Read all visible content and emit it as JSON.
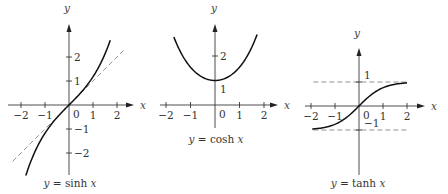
{
  "chart_data": [
    {
      "type": "line",
      "title": "y = sinh x",
      "caption": {
        "prefix": "y",
        "eq": " = sinh ",
        "var": "x"
      },
      "xlabel": "x",
      "ylabel": "y",
      "xlim": [
        -2,
        2.5
      ],
      "ylim": [
        -2.9,
        3.3
      ],
      "x_ticks": [
        -2,
        -1,
        1,
        2
      ],
      "x_tick_labels": [
        "−2",
        "−1",
        "1",
        "2"
      ],
      "y_ticks": [
        -2,
        -1,
        1,
        2
      ],
      "y_tick_labels": [
        "−2",
        "−1",
        "1",
        "2"
      ],
      "origin_label": "0",
      "series": [
        {
          "name": "sinh x",
          "style": "solid",
          "function": "sinh",
          "x_range": [
            -1.8,
            1.72
          ],
          "x": [
            -1.8,
            -1.5,
            -1.0,
            -0.5,
            0,
            0.5,
            1.0,
            1.5,
            1.72
          ],
          "y": [
            -2.94,
            -2.13,
            -1.18,
            -0.52,
            0,
            0.52,
            1.18,
            2.13,
            2.71
          ]
        },
        {
          "name": "y = x (asymptote near origin)",
          "style": "dashed",
          "function": "identity",
          "x_range": [
            -2.35,
            2.3
          ],
          "x": [
            -2.35,
            2.3
          ],
          "y": [
            -2.35,
            2.3
          ]
        }
      ],
      "grid": false,
      "legend": "none"
    },
    {
      "type": "line",
      "title": "y = cosh x",
      "caption": {
        "prefix": "y",
        "eq": " = cosh ",
        "var": "x"
      },
      "xlabel": "x",
      "ylabel": "y",
      "xlim": [
        -2.1,
        2.5
      ],
      "ylim": [
        -0.95,
        3.3
      ],
      "x_ticks": [
        -2,
        -1,
        1,
        2
      ],
      "x_tick_labels": [
        "−2",
        "−1",
        "1",
        "2"
      ],
      "y_ticks": [
        1,
        2
      ],
      "y_tick_labels": [
        "1",
        "2"
      ],
      "origin_label": "0",
      "series": [
        {
          "name": "cosh x",
          "style": "solid",
          "function": "cosh",
          "x_range": [
            -1.68,
            1.72
          ],
          "x": [
            -1.68,
            -1.5,
            -1.0,
            -0.5,
            0,
            0.5,
            1.0,
            1.5,
            1.72
          ],
          "y": [
            2.77,
            2.35,
            1.54,
            1.13,
            1.0,
            1.13,
            1.54,
            2.35,
            2.88
          ]
        }
      ],
      "grid": false,
      "legend": "none"
    },
    {
      "type": "line",
      "title": "y = tanh x",
      "caption": {
        "prefix": "y",
        "eq": " = tanh ",
        "var": "x"
      },
      "xlabel": "x",
      "ylabel": "y",
      "xlim": [
        -2.1,
        2.5
      ],
      "ylim": [
        -2.8,
        2.4
      ],
      "x_ticks": [
        -2,
        -1,
        1,
        2
      ],
      "x_tick_labels": [
        "−2",
        "−1",
        "1",
        "2"
      ],
      "y_ticks": [
        1,
        -1
      ],
      "y_tick_labels": [
        "1",
        "−1"
      ],
      "origin_label": "0",
      "series": [
        {
          "name": "tanh x",
          "style": "solid",
          "function": "tanh",
          "x_range": [
            -1.95,
            2.0
          ],
          "x": [
            -1.95,
            -1.5,
            -1.0,
            -0.5,
            0,
            0.5,
            1.0,
            1.5,
            2.0
          ],
          "y": [
            -0.96,
            -0.91,
            -0.76,
            -0.46,
            0,
            0.46,
            0.76,
            0.91,
            0.96
          ]
        },
        {
          "name": "y = 1 asymptote",
          "style": "dashed",
          "x": [
            -1.9,
            2.0
          ],
          "y": [
            1,
            1
          ]
        },
        {
          "name": "y = -1 asymptote",
          "style": "dashed",
          "x": [
            -1.9,
            2.0
          ],
          "y": [
            -1,
            -1
          ]
        }
      ],
      "grid": false,
      "legend": "none"
    }
  ],
  "layout": [
    {
      "ox": 69,
      "oy": 105,
      "unit": 24,
      "xaxis": [
        8,
        134
      ],
      "yaxis": [
        24,
        175
      ],
      "ylabel_pos": [
        67,
        12
      ],
      "caption_pos": [
        70,
        187
      ]
    },
    {
      "ox": 215,
      "oy": 105,
      "unit": 24.5,
      "xaxis": [
        160,
        278
      ],
      "yaxis": [
        24,
        128
      ],
      "ylabel_pos": [
        214,
        12
      ],
      "caption_pos": [
        216,
        143
      ]
    },
    {
      "ox": 359,
      "oy": 106,
      "unit": 24,
      "xaxis": [
        305,
        425
      ],
      "yaxis": [
        48,
        175
      ],
      "ylabel_pos": [
        357,
        37
      ],
      "caption_pos": [
        358,
        187
      ]
    }
  ]
}
